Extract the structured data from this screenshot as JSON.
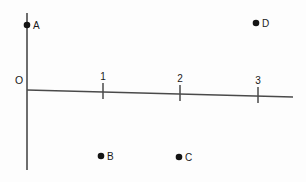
{
  "figure": {
    "background_color": "#fdfdfd",
    "ink_color": "#4a4a4a",
    "dot_color": "#141414",
    "origin_label": "O"
  },
  "chart_data": {
    "type": "scatter",
    "title": "",
    "xlabel": "",
    "ylabel": "",
    "grid": false,
    "legend": "none",
    "axes": {
      "x_axis": {
        "visible": true,
        "tick_labels": [
          "1",
          "2",
          "3"
        ],
        "tick_values": [
          1,
          2,
          3
        ],
        "xlim": [
          0,
          3.4
        ]
      },
      "y_axis": {
        "visible": true,
        "tick_labels": [],
        "tick_values": [],
        "ylim": [
          -1.1,
          0.85
        ]
      },
      "origin_label": "O"
    },
    "points": [
      {
        "label": "A",
        "x": 0,
        "y": 0.81,
        "on_axis": "y-axis"
      },
      {
        "label": "B",
        "x": 0.98,
        "y": -0.83,
        "on_axis": "none"
      },
      {
        "label": "C",
        "x": 1.96,
        "y": -0.86,
        "on_axis": "none"
      },
      {
        "label": "D",
        "x": 2.99,
        "y": 0.84,
        "on_axis": "none"
      }
    ]
  },
  "geometry": {
    "y_axis": {
      "x": 27,
      "y_top": 13,
      "y_bottom": 170
    },
    "x_axis": {
      "x_left": 27,
      "y_left": 90,
      "x_right": 293,
      "y_right": 97
    },
    "origin_label_pos": {
      "x": 19,
      "y": 84
    },
    "ticks": [
      {
        "label": "1",
        "x": 103,
        "y_center": 91,
        "half_height": 8,
        "label_x": 103,
        "label_y": 80
      },
      {
        "label": "2",
        "x": 180,
        "y_center": 93,
        "half_height": 8,
        "label_x": 180,
        "label_y": 82
      },
      {
        "label": "3",
        "x": 258,
        "y_center": 95,
        "half_height": 8,
        "label_x": 258,
        "label_y": 84
      }
    ],
    "dots": [
      {
        "label": "A",
        "cx": 27,
        "cy": 25,
        "r": 3.3,
        "label_x": 33,
        "label_y": 29
      },
      {
        "label": "D",
        "cx": 256,
        "cy": 23,
        "r": 3.3,
        "label_x": 262,
        "label_y": 27
      },
      {
        "label": "B",
        "cx": 101,
        "cy": 156,
        "r": 3.3,
        "label_x": 107,
        "label_y": 160
      },
      {
        "label": "C",
        "cx": 179,
        "cy": 157,
        "r": 3.3,
        "label_x": 185,
        "label_y": 161
      }
    ]
  }
}
